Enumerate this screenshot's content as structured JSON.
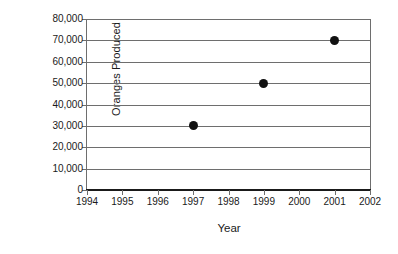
{
  "chart_data": {
    "type": "scatter",
    "title": "",
    "xlabel": "Year",
    "ylabel": "Oranges Produced",
    "x": [
      1997,
      1999,
      2001
    ],
    "values": [
      30000,
      50000,
      70000
    ],
    "series": [
      {
        "name": "Oranges Produced",
        "points": [
          {
            "x": 1997,
            "y": 30000
          },
          {
            "x": 1999,
            "y": 50000
          },
          {
            "x": 2001,
            "y": 70000
          }
        ]
      }
    ],
    "xlim": [
      1994,
      2002
    ],
    "ylim": [
      0,
      80000
    ],
    "x_tick_labels": [
      "1994",
      "1995",
      "1996",
      "1997",
      "1998",
      "1999",
      "2000",
      "2001",
      "2002"
    ],
    "x_tick_values": [
      1994,
      1995,
      1996,
      1997,
      1998,
      1999,
      2000,
      2001,
      2002
    ],
    "y_tick_labels": [
      "80,000",
      "70,000",
      "60,000",
      "50,000",
      "40,000",
      "30,000",
      "20,000",
      "10,000",
      "0"
    ],
    "y_tick_values": [
      80000,
      70000,
      60000,
      50000,
      40000,
      30000,
      20000,
      10000,
      0
    ],
    "grid": "horizontal",
    "legend": "none",
    "marker": "filled-circle",
    "marker_color": "#111111",
    "gridline_color": "#6e6e6e",
    "axis_color": "#1a1a1a",
    "background_color": "#ffffff"
  }
}
